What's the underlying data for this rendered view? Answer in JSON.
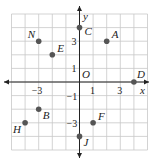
{
  "grid": {
    "xmin": -5,
    "xmax": 5,
    "ymin": -5,
    "ymax": 6,
    "origin_px": [
      79.5,
      82
    ],
    "cell_px": 13.6,
    "grid_color": "#c8c8c8",
    "axis_color": "#222222",
    "point_color": "#555555"
  },
  "axes": {
    "x_label": "x",
    "y_label": "y",
    "origin_label": "O",
    "x_ticks": [
      {
        "value": -3,
        "label": "−3"
      },
      {
        "value": 1,
        "label": "1"
      },
      {
        "value": 3,
        "label": "3"
      }
    ],
    "y_ticks": [
      {
        "value": 3,
        "label": "3"
      },
      {
        "value": 1,
        "label": "1"
      },
      {
        "value": -1,
        "label": "−1"
      },
      {
        "value": -3,
        "label": "−3"
      }
    ]
  },
  "points": [
    {
      "name": "A",
      "x": 2,
      "y": 3,
      "label_dx": 5,
      "label_dy": -3
    },
    {
      "name": "C",
      "x": 0,
      "y": 4,
      "label_dx": 5,
      "label_dy": 7
    },
    {
      "name": "N",
      "x": -3,
      "y": 3,
      "label_dx": -11,
      "label_dy": -3
    },
    {
      "name": "E",
      "x": -2,
      "y": 2,
      "label_dx": 5,
      "label_dy": -3
    },
    {
      "name": "D",
      "x": 4,
      "y": 0,
      "label_dx": 3,
      "label_dy": -4
    },
    {
      "name": "B",
      "x": -3,
      "y": -2,
      "label_dx": 4,
      "label_dy": 10
    },
    {
      "name": "H",
      "x": -4,
      "y": -3,
      "label_dx": -12,
      "label_dy": 10
    },
    {
      "name": "F",
      "x": 1,
      "y": -3,
      "label_dx": 5,
      "label_dy": -3
    },
    {
      "name": "J",
      "x": 0,
      "y": -4,
      "label_dx": 4,
      "label_dy": 10
    }
  ]
}
